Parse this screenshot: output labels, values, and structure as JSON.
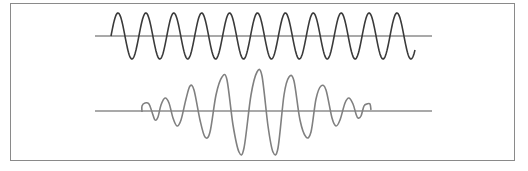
{
  "figure": {
    "caption_visible": "",
    "colors": {
      "frame": "#8a8a8a",
      "axis": "#8c8c8c",
      "top_wave": "#3a3a3a",
      "bottom_wave": "#808080"
    },
    "top_wave": {
      "type": "sinusoid",
      "cycles": 11,
      "baseline_y": 36,
      "axis_x": [
        95,
        432
      ],
      "start_x": 111,
      "end_x": 415,
      "period_px": 27.9,
      "amplitude_px": 23
    },
    "bottom_wave": {
      "type": "wave-packet",
      "baseline_y": 111,
      "axis_x": [
        95,
        432
      ],
      "points": [
        [
          142,
          112
        ],
        [
          142,
          106
        ],
        [
          145,
          103
        ],
        [
          149,
          104
        ],
        [
          152,
          112
        ],
        [
          155,
          120
        ],
        [
          158,
          117
        ],
        [
          161,
          105
        ],
        [
          165,
          98
        ],
        [
          169,
          103
        ],
        [
          173,
          118
        ],
        [
          177,
          126
        ],
        [
          181,
          120
        ],
        [
          186,
          99
        ],
        [
          190,
          86
        ],
        [
          194,
          90
        ],
        [
          200,
          120
        ],
        [
          205,
          137
        ],
        [
          210,
          132
        ],
        [
          216,
          95
        ],
        [
          222,
          77
        ],
        [
          227,
          80
        ],
        [
          233,
          125
        ],
        [
          239,
          152
        ],
        [
          244,
          148
        ],
        [
          251,
          95
        ],
        [
          257,
          72
        ],
        [
          262,
          76
        ],
        [
          268,
          126
        ],
        [
          273,
          152
        ],
        [
          278,
          148
        ],
        [
          284,
          95
        ],
        [
          289,
          77
        ],
        [
          294,
          81
        ],
        [
          300,
          120
        ],
        [
          306,
          137
        ],
        [
          311,
          132
        ],
        [
          316,
          99
        ],
        [
          321,
          86
        ],
        [
          326,
          90
        ],
        [
          332,
          118
        ],
        [
          336,
          126
        ],
        [
          340,
          120
        ],
        [
          345,
          103
        ],
        [
          349,
          98
        ],
        [
          353,
          104
        ],
        [
          356,
          114
        ],
        [
          358,
          118
        ],
        [
          361,
          116
        ],
        [
          364,
          106
        ],
        [
          367,
          104
        ],
        [
          370,
          104
        ],
        [
          371,
          110
        ]
      ]
    }
  }
}
